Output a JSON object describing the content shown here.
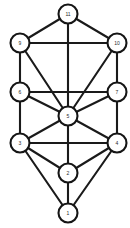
{
  "diagram": {
    "type": "undirected-graph",
    "background_color": "#ffffff",
    "edge_color": "#1a1a1a",
    "node_fill_color": "#ffffff",
    "node_stroke_color": "#151515",
    "label_color": "#2b2b2b",
    "node_radius": 9.5,
    "node_count": 11,
    "edge_count": 22,
    "canvas": {
      "width": 130,
      "height": 228
    },
    "nodes": [
      {
        "id": "11",
        "label": "11",
        "x": 68,
        "y": 14
      },
      {
        "id": "9",
        "label": "9",
        "x": 20,
        "y": 43
      },
      {
        "id": "10",
        "label": "10",
        "x": 117,
        "y": 43
      },
      {
        "id": "6",
        "label": "6",
        "x": 20,
        "y": 92
      },
      {
        "id": "7",
        "label": "7",
        "x": 117,
        "y": 92
      },
      {
        "id": "5",
        "label": "5",
        "x": 68,
        "y": 116
      },
      {
        "id": "3",
        "label": "3",
        "x": 20,
        "y": 143
      },
      {
        "id": "4",
        "label": "4",
        "x": 117,
        "y": 143
      },
      {
        "id": "2",
        "label": "2",
        "x": 68,
        "y": 173
      },
      {
        "id": "1",
        "label": "1",
        "x": 68,
        "y": 213
      }
    ],
    "edges": [
      {
        "from": "11",
        "to": "9"
      },
      {
        "from": "11",
        "to": "10"
      },
      {
        "from": "11",
        "to": "5"
      },
      {
        "from": "9",
        "to": "10"
      },
      {
        "from": "9",
        "to": "6"
      },
      {
        "from": "9",
        "to": "5"
      },
      {
        "from": "10",
        "to": "7"
      },
      {
        "from": "10",
        "to": "5"
      },
      {
        "from": "6",
        "to": "7"
      },
      {
        "from": "6",
        "to": "5"
      },
      {
        "from": "6",
        "to": "3"
      },
      {
        "from": "7",
        "to": "5"
      },
      {
        "from": "7",
        "to": "4"
      },
      {
        "from": "5",
        "to": "3"
      },
      {
        "from": "5",
        "to": "4"
      },
      {
        "from": "5",
        "to": "2"
      },
      {
        "from": "3",
        "to": "4"
      },
      {
        "from": "3",
        "to": "2"
      },
      {
        "from": "3",
        "to": "1"
      },
      {
        "from": "4",
        "to": "2"
      },
      {
        "from": "4",
        "to": "1"
      },
      {
        "from": "2",
        "to": "1"
      }
    ]
  }
}
